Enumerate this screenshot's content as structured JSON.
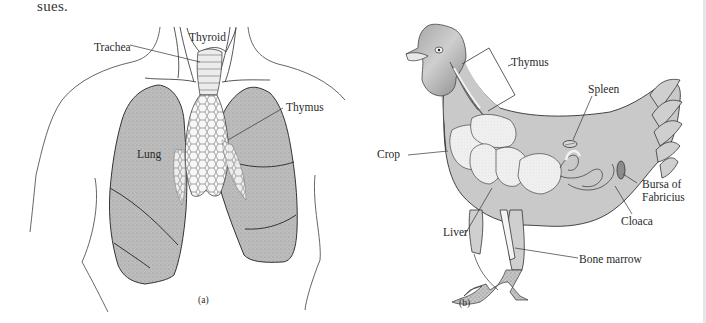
{
  "lead_text": "sues.",
  "figure_a": {
    "caption": "(a)",
    "subject": "human-thorax",
    "labels": {
      "thyroid": "Thyroid",
      "trachea": "Trachea",
      "thymus": "Thymus",
      "lung": "Lung"
    }
  },
  "figure_b": {
    "caption": "(b)",
    "subject": "chicken",
    "labels": {
      "thymus": "Thymus",
      "spleen": "Spleen",
      "crop": "Crop",
      "bursa_line1": "Bursa of",
      "bursa_line2": "Fabricius",
      "cloaca": "Cloaca",
      "liver": "Liver",
      "bone_marrow": "Bone marrow"
    }
  },
  "colors": {
    "organ_fill": "#b9b9b9",
    "body_fill": "#c8c8c8",
    "light_organ_fill": "#ececec",
    "line": "#333333"
  }
}
